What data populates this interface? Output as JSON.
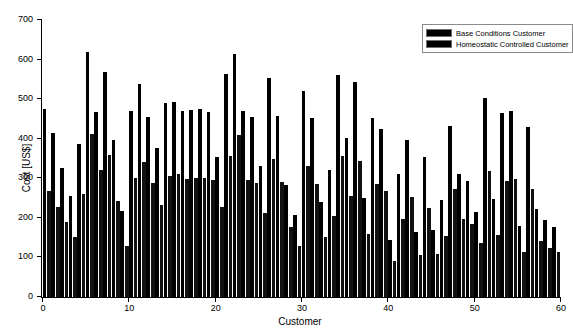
{
  "chart_data": {
    "type": "bar",
    "title": "",
    "xlabel": "Customer",
    "ylabel": "Cost [US$]",
    "xlim": [
      0,
      60
    ],
    "ylim": [
      0,
      700
    ],
    "ytick_values": [
      0,
      100,
      200,
      300,
      400,
      500,
      600,
      700
    ],
    "xtick_values": [
      0,
      10,
      20,
      30,
      40,
      50,
      60
    ],
    "grid": false,
    "legend_position": "top-right",
    "bar_color": "#000000",
    "categories": [
      1,
      2,
      3,
      4,
      5,
      6,
      7,
      8,
      9,
      10,
      11,
      12,
      13,
      14,
      15,
      16,
      17,
      18,
      19,
      20,
      21,
      22,
      23,
      24,
      25,
      26,
      27,
      28,
      29,
      30,
      31,
      32,
      33,
      34,
      35,
      36,
      37,
      38,
      39,
      40,
      41,
      42,
      43,
      44,
      45,
      46,
      47,
      48,
      49,
      50,
      51,
      52,
      53,
      54,
      55,
      56,
      57,
      58,
      59,
      60
    ],
    "series": [
      {
        "name": "Base Conditions Customer",
        "color": "#000000",
        "values": [
          476,
          415,
          326,
          255,
          387,
          618,
          468,
          568,
          396,
          218,
          470,
          538,
          455,
          377,
          490,
          492,
          470,
          473,
          475,
          468,
          355,
          563,
          615,
          470,
          455,
          330,
          553,
          458,
          282,
          207,
          520,
          452,
          240,
          322,
          562,
          403,
          543,
          250,
          452,
          425,
          144,
          311,
          398,
          165,
          355,
          170,
          244,
          432,
          311,
          292,
          215,
          502,
          248,
          465,
          470,
          180,
          430,
          222,
          195,
          178
        ]
      },
      {
        "name": "Homeostatic Controlled Customer",
        "color": "#111111",
        "values": [
          268,
          228,
          190,
          152,
          260,
          412,
          320,
          358,
          243,
          130,
          300,
          340,
          288,
          233,
          305,
          312,
          298,
          300,
          302,
          296,
          228,
          356,
          410,
          296,
          288,
          212,
          350,
          290,
          178,
          128,
          330,
          286,
          152,
          205,
          356,
          256,
          344,
          158,
          286,
          268,
          92,
          197,
          252,
          105,
          225,
          108,
          155,
          274,
          197,
          185,
          136,
          318,
          157,
          294,
          298,
          114,
          272,
          141,
          124,
          113
        ]
      }
    ]
  },
  "legend": {
    "entries": [
      {
        "label": "Base Conditions Customer"
      },
      {
        "label": "Homeostatic Controlled Customer"
      }
    ]
  }
}
